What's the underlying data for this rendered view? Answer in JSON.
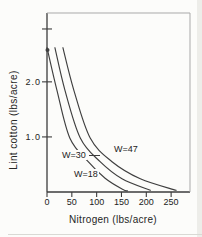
{
  "figure_title": "Lint cotton response to nitrogen",
  "chart_data": {
    "type": "line",
    "title": "",
    "xlabel": "Nitrogen (lbs/acre)",
    "ylabel": "Lint cotton (lbs/acre)",
    "xlim": [
      0,
      288
    ],
    "ylim": [
      0,
      3.25
    ],
    "grid": false,
    "legend_position": "inline-annotations",
    "x_ticks": [
      {
        "value": 0,
        "label": "0"
      },
      {
        "value": 50,
        "label": "50"
      },
      {
        "value": 100,
        "label": "100"
      },
      {
        "value": 150,
        "label": "150"
      },
      {
        "value": 200,
        "label": "200"
      },
      {
        "value": 250,
        "label": "250"
      }
    ],
    "y_ticks": [
      {
        "value": 1.0,
        "label": "1.0"
      },
      {
        "value": 2.0,
        "label": "2.0"
      },
      {
        "value": 2.96,
        "label": ""
      }
    ],
    "series": [
      {
        "label": "W=18",
        "points": [
          [
            0,
            2.62
          ],
          [
            20,
            1.85
          ],
          [
            46,
            0.98
          ],
          [
            83,
            0.55
          ],
          [
            117,
            0.25
          ],
          [
            152,
            0.05
          ],
          [
            162,
            0.02
          ]
        ]
      },
      {
        "label": "W=30",
        "points": [
          [
            16,
            2.62
          ],
          [
            36,
            1.85
          ],
          [
            67,
            0.98
          ],
          [
            107,
            0.55
          ],
          [
            151,
            0.24
          ],
          [
            208,
            0.03
          ]
        ]
      },
      {
        "label": "W=47",
        "points": [
          [
            32,
            2.62
          ],
          [
            54,
            1.85
          ],
          [
            87,
            0.98
          ],
          [
            131,
            0.55
          ],
          [
            188,
            0.24
          ],
          [
            260,
            0.03
          ]
        ]
      }
    ],
    "annotations": [
      {
        "text": "W=30",
        "has_leader_line": true,
        "refers_to": "middle curve"
      },
      {
        "text": "W=47",
        "has_leader_line": false,
        "refers_to": "rightmost curve"
      },
      {
        "text": "W=18",
        "has_leader_line": false,
        "refers_to": "leftmost curve"
      }
    ]
  },
  "colors": {
    "curve": "#3f3f3f",
    "axis_dark": "#3c3c3c",
    "axis_light": "#a9a9a9",
    "text": "#222222",
    "background": "#fcfcfa"
  }
}
